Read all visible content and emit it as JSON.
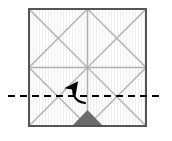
{
  "diagram": {
    "title": "Origami crease pattern fold step",
    "type": "paper-folding-instruction",
    "caption": "",
    "canvas": {
      "width": 172,
      "height": 141,
      "background": "#ffffff"
    },
    "paper": {
      "name": "square-sheet",
      "x": 29,
      "y": 9,
      "width": 117,
      "height": 117,
      "fill": "#fcfcfc",
      "border_color": "#555555",
      "border_width": 2,
      "texture": "vertical-stripes",
      "texture_color": "#f0f0f0"
    },
    "crease_lines": {
      "color": "#b8b8b8",
      "width": 1.6,
      "description": "2x2 grid of squares, each quadrant crossed by both diagonals",
      "grid": {
        "vertical_positions": [
          87.5
        ],
        "horizontal_positions": [
          67.5
        ]
      },
      "diagonals": [
        {
          "x1": 29,
          "y1": 9,
          "x2": 87.5,
          "y2": 67.5
        },
        {
          "x1": 87.5,
          "y1": 9,
          "x2": 29,
          "y2": 67.5
        },
        {
          "x1": 87.5,
          "y1": 9,
          "x2": 146,
          "y2": 67.5
        },
        {
          "x1": 146,
          "y1": 9,
          "x2": 87.5,
          "y2": 67.5
        },
        {
          "x1": 29,
          "y1": 67.5,
          "x2": 87.5,
          "y2": 126
        },
        {
          "x1": 87.5,
          "y1": 67.5,
          "x2": 29,
          "y2": 126
        },
        {
          "x1": 87.5,
          "y1": 67.5,
          "x2": 146,
          "y2": 126
        },
        {
          "x1": 146,
          "y1": 67.5,
          "x2": 87.5,
          "y2": 126
        }
      ]
    },
    "fold_line": {
      "name": "horizontal-dashed-fold-line",
      "style": "dashed",
      "color": "#000000",
      "width": 2,
      "dash_pattern": "7,5",
      "y": 96,
      "x_start": 8,
      "x_end": 164
    },
    "fold_arrow": {
      "name": "curved-fold-arrow",
      "color": "#000000",
      "direction": "up-left-curving",
      "meaning": "fold bottom edge upward along dashed line",
      "path": "M 85 103 C 74 101 71 92 76 84",
      "head_tip": {
        "x": 86,
        "y": 72
      },
      "stroke_width": 2
    },
    "shaded_region": {
      "name": "bottom-shaded-triangle",
      "fill": "#6b6b6b",
      "points": "72,126 87.5,110 103,126",
      "description": "dark grey triangle at bottom centre of sheet"
    }
  }
}
